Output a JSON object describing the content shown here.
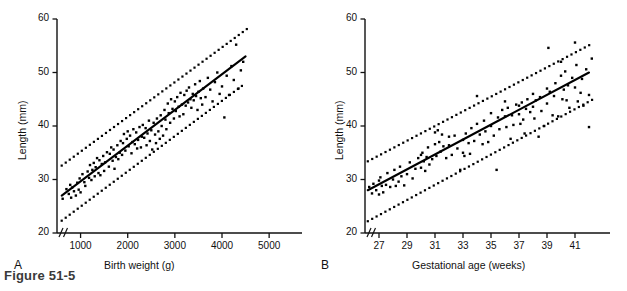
{
  "figure": {
    "caption": "Figure 51-5",
    "background": "#ffffff",
    "ink": "#000000"
  },
  "chart_data": [
    {
      "panel": "A",
      "panel_label": "A",
      "type": "scatter",
      "title": "",
      "xlabel": "Birth weight (g)",
      "ylabel": "Length (mm)",
      "xlim": [
        500,
        5400
      ],
      "ylim": [
        20,
        60
      ],
      "xticks": [
        1000,
        2000,
        3000,
        4000,
        5000
      ],
      "xtick_labels": [
        "1000",
        "2000",
        "3000",
        "4000",
        "5000"
      ],
      "yticks": [
        20,
        30,
        40,
        50,
        60
      ],
      "ytick_labels": [
        "20",
        "30",
        "40",
        "50",
        "60"
      ],
      "grid": false,
      "legend": "none",
      "axis_break": true,
      "axis_break_note": "double-slash break on both axes near origin",
      "fit_line": {
        "style": "solid",
        "label": "regression line",
        "x": [
          600,
          4500
        ],
        "y": [
          27.0,
          53.0
        ]
      },
      "upper_band": {
        "style": "dotted",
        "label": "upper prediction limit",
        "x": [
          600,
          4600
        ],
        "y": [
          32.6,
          58.6
        ]
      },
      "lower_band": {
        "style": "dotted",
        "label": "lower prediction limit",
        "x": [
          600,
          4500
        ],
        "y": [
          22.3,
          48.0
        ]
      },
      "x": [
        620,
        700,
        750,
        780,
        800,
        820,
        860,
        900,
        930,
        960,
        980,
        1000,
        1040,
        1080,
        1100,
        1150,
        1180,
        1200,
        1230,
        1250,
        1280,
        1300,
        1320,
        1350,
        1380,
        1400,
        1420,
        1450,
        1480,
        1500,
        1520,
        1560,
        1600,
        1620,
        1650,
        1680,
        1700,
        1720,
        1750,
        1780,
        1800,
        1830,
        1850,
        1880,
        1900,
        1920,
        1950,
        1980,
        2000,
        2020,
        2050,
        2080,
        2100,
        2120,
        2150,
        2180,
        2200,
        2220,
        2250,
        2280,
        2300,
        2320,
        2350,
        2380,
        2400,
        2420,
        2450,
        2470,
        2500,
        2520,
        2550,
        2580,
        2600,
        2620,
        2650,
        2680,
        2700,
        2720,
        2750,
        2780,
        2800,
        2820,
        2850,
        2870,
        2900,
        2920,
        2950,
        2980,
        3000,
        3020,
        3050,
        3080,
        3100,
        3120,
        3150,
        3180,
        3200,
        3230,
        3250,
        3280,
        3300,
        3330,
        3350,
        3380,
        3400,
        3430,
        3450,
        3480,
        3500,
        3530,
        3550,
        3580,
        3600,
        3650,
        3700,
        3750,
        3800,
        3850,
        3900,
        3950,
        4000,
        4050,
        4100,
        4150,
        4200,
        4250,
        4300,
        4350,
        4400,
        4450
      ],
      "y": [
        26.4,
        28.2,
        27.3,
        29.0,
        26.6,
        28.5,
        27.8,
        27.0,
        29.4,
        28.1,
        30.2,
        27.6,
        31.0,
        29.5,
        28.8,
        31.5,
        30.3,
        32.7,
        29.9,
        31.8,
        33.1,
        30.6,
        32.3,
        34.0,
        31.2,
        33.6,
        30.8,
        32.9,
        34.4,
        31.6,
        33.2,
        35.1,
        32.4,
        34.8,
        36.0,
        33.5,
        35.6,
        32.0,
        34.2,
        36.4,
        33.8,
        35.0,
        37.2,
        34.6,
        36.8,
        38.5,
        35.4,
        37.6,
        39.0,
        36.2,
        38.2,
        34.9,
        37.0,
        39.4,
        36.6,
        38.8,
        35.8,
        37.4,
        39.8,
        36.0,
        38.0,
        40.2,
        37.8,
        39.6,
        36.4,
        38.6,
        41.0,
        37.2,
        39.2,
        35.6,
        40.6,
        38.4,
        36.8,
        41.4,
        39.0,
        37.6,
        42.0,
        40.0,
        38.2,
        43.0,
        41.2,
        39.4,
        44.2,
        42.4,
        40.6,
        45.0,
        43.2,
        41.4,
        44.6,
        42.8,
        45.4,
        43.6,
        41.8,
        46.2,
        44.0,
        42.2,
        45.8,
        43.8,
        46.6,
        44.4,
        47.2,
        45.0,
        43.4,
        46.0,
        44.8,
        47.8,
        45.6,
        43.0,
        46.4,
        48.4,
        45.2,
        44.0,
        47.0,
        45.4,
        49.0,
        46.8,
        44.6,
        48.2,
        50.0,
        46.0,
        47.4,
        41.6,
        49.4,
        45.8,
        51.2,
        48.6,
        55.2,
        47.0,
        50.4,
        52.0
      ],
      "n_points": 129,
      "description": "Organ length versus birth weight with fitted regression line and dotted 95% prediction limits"
    },
    {
      "panel": "B",
      "panel_label": "B",
      "type": "scatter",
      "title": "",
      "xlabel": "Gestational age (weeks)",
      "ylabel": "Length (mm)",
      "xlim": [
        26,
        42.5
      ],
      "ylim": [
        20,
        60
      ],
      "xticks": [
        27,
        29,
        31,
        33,
        35,
        37,
        39,
        41
      ],
      "xtick_labels": [
        "27",
        "29",
        "31",
        "33",
        "35",
        "37",
        "39",
        "41"
      ],
      "yticks": [
        20,
        30,
        40,
        50,
        60
      ],
      "ytick_labels": [
        "20",
        "30",
        "40",
        "50",
        "60"
      ],
      "grid": false,
      "legend": "none",
      "axis_break": true,
      "axis_break_note": "double-slash break on both axes near origin",
      "fit_line": {
        "style": "solid",
        "label": "regression line",
        "x": [
          26.2,
          42.0
        ],
        "y": [
          28.0,
          50.0
        ]
      },
      "upper_band": {
        "style": "dotted",
        "label": "upper prediction limit",
        "x": [
          26.2,
          42.3
        ],
        "y": [
          33.4,
          55.5
        ]
      },
      "lower_band": {
        "style": "dotted",
        "label": "lower prediction limit",
        "x": [
          26.2,
          42.3
        ],
        "y": [
          22.2,
          45.0
        ]
      },
      "x": [
        26.3,
        26.5,
        26.6,
        26.8,
        27.0,
        27.0,
        27.1,
        27.2,
        27.3,
        27.5,
        27.6,
        27.8,
        28.0,
        28.1,
        28.2,
        28.4,
        28.5,
        28.6,
        28.8,
        29.0,
        29.2,
        29.4,
        29.6,
        29.8,
        30.0,
        30.0,
        30.1,
        30.2,
        30.3,
        30.4,
        30.5,
        30.6,
        30.8,
        31.0,
        31.0,
        31.1,
        31.2,
        31.3,
        31.4,
        31.5,
        31.6,
        31.8,
        32.0,
        32.0,
        32.2,
        32.4,
        32.6,
        32.8,
        33.0,
        33.0,
        33.1,
        33.2,
        33.4,
        33.5,
        33.6,
        33.8,
        34.0,
        34.0,
        34.2,
        34.4,
        34.5,
        34.6,
        34.8,
        35.0,
        35.0,
        35.2,
        35.4,
        35.5,
        35.6,
        35.8,
        36.0,
        36.0,
        36.1,
        36.2,
        36.4,
        36.5,
        36.6,
        36.8,
        37.0,
        37.0,
        37.1,
        37.2,
        37.3,
        37.4,
        37.5,
        37.6,
        37.8,
        38.0,
        38.0,
        38.1,
        38.2,
        38.4,
        38.5,
        38.6,
        38.8,
        39.0,
        39.0,
        39.1,
        39.2,
        39.4,
        39.5,
        39.6,
        39.8,
        40.0,
        40.0,
        40.1,
        40.2,
        40.3,
        40.4,
        40.5,
        40.6,
        40.8,
        41.0,
        41.0,
        41.1,
        41.2,
        41.4,
        41.5,
        41.6,
        41.8,
        42.0,
        42.0,
        42.2
      ],
      "y": [
        28.6,
        27.4,
        29.2,
        28.0,
        29.8,
        27.2,
        30.4,
        28.8,
        27.6,
        29.0,
        31.2,
        28.6,
        30.0,
        31.8,
        28.8,
        29.6,
        32.4,
        30.6,
        28.9,
        31.0,
        33.2,
        30.2,
        32.0,
        34.0,
        34.6,
        32.2,
        35.0,
        33.4,
        31.6,
        34.2,
        36.0,
        32.8,
        33.8,
        38.8,
        36.6,
        34.4,
        39.2,
        37.0,
        35.2,
        38.4,
        36.2,
        34.0,
        38.0,
        36.4,
        34.6,
        38.2,
        35.8,
        31.8,
        37.4,
        35.0,
        34.4,
        38.6,
        36.8,
        34.8,
        39.6,
        37.2,
        45.6,
        40.4,
        38.4,
        36.6,
        41.0,
        39.0,
        37.0,
        42.4,
        40.0,
        38.2,
        31.8,
        41.6,
        39.4,
        43.0,
        44.6,
        41.8,
        39.8,
        43.4,
        37.6,
        42.0,
        40.2,
        44.0,
        43.8,
        42.2,
        40.4,
        44.4,
        41.2,
        38.6,
        43.2,
        45.0,
        42.6,
        46.0,
        43.6,
        41.4,
        44.8,
        38.0,
        45.4,
        42.8,
        40.0,
        47.0,
        44.2,
        54.6,
        46.4,
        42.0,
        45.6,
        48.0,
        41.8,
        52.0,
        49.4,
        45.0,
        46.8,
        50.2,
        44.8,
        47.6,
        43.4,
        49.0,
        55.6,
        47.2,
        51.4,
        44.6,
        46.2,
        48.8,
        43.8,
        50.6,
        45.8,
        39.8,
        52.6
      ],
      "n_points": 123,
      "description": "Organ length versus gestational age with fitted regression line and dotted 95% prediction limits"
    }
  ],
  "panel_a": {
    "letter": "A",
    "xlabel": "Birth weight (g)",
    "ylabel": "Length (mm)",
    "xtick_labels": [
      "1000",
      "2000",
      "3000",
      "4000",
      "5000"
    ],
    "ytick_labels": [
      "20",
      "30",
      "40",
      "50",
      "60"
    ]
  },
  "panel_b": {
    "letter": "B",
    "xlabel": "Gestational age (weeks)",
    "ylabel": "Length (mm)",
    "xtick_labels": [
      "27",
      "29",
      "31",
      "33",
      "35",
      "37",
      "39",
      "41"
    ],
    "ytick_labels": [
      "20",
      "30",
      "40",
      "50",
      "60"
    ]
  }
}
